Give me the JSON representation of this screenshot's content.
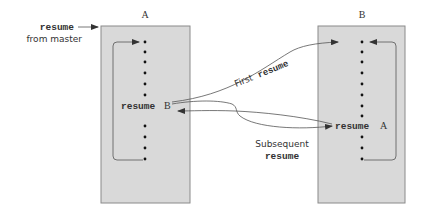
{
  "diagram": {
    "title_a": "A",
    "title_b": "B",
    "entry_label": {
      "keyword": "resume",
      "text": "from master"
    },
    "box_a": {
      "statement_keyword": "resume",
      "statement_target": "B"
    },
    "box_b": {
      "statement_keyword": "resume",
      "statement_target": "A"
    },
    "first_label": {
      "text": "First",
      "keyword": "resume"
    },
    "subsequent_label": {
      "text": "Subsequent",
      "keyword": "resume"
    },
    "colors": {
      "box_fill": "#d9d9d9",
      "box_border": "#8a8a8a",
      "line": "#555555",
      "text": "#333333"
    }
  }
}
